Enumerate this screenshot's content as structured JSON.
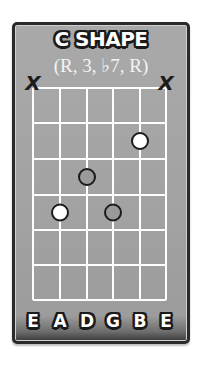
{
  "diagram": {
    "title": "C SHAPE",
    "subtitle": "(R, 3, ♭7, R)",
    "strings": [
      "E",
      "A",
      "D",
      "G",
      "B",
      "E"
    ],
    "string_x": [
      33,
      60,
      87,
      113,
      140,
      166
    ],
    "fret_y": [
      88,
      123,
      159,
      195,
      230,
      265,
      300
    ],
    "muted": [
      {
        "string_index": 0,
        "symbol": "X"
      },
      {
        "string_index": 5,
        "symbol": "X"
      }
    ],
    "dots": [
      {
        "string_index": 4,
        "string": "B",
        "fret": 2,
        "style": "white",
        "role": "R"
      },
      {
        "string_index": 2,
        "string": "D",
        "fret": 3,
        "style": "gray",
        "role": "♭7"
      },
      {
        "string_index": 1,
        "string": "A",
        "fret": 4,
        "style": "white",
        "role": "R"
      },
      {
        "string_index": 3,
        "string": "G",
        "fret": 4,
        "style": "gray",
        "role": "3"
      }
    ],
    "colors": {
      "board": "#a3a3a3",
      "border": "#2a2a2a",
      "grid_line": "#ffffff",
      "dot_white": "#ffffff",
      "dot_gray": "#9a9a9a",
      "dot_outline": "#1a1a1a",
      "text_fill": "#ffffff",
      "text_outline": "#1a1a1a"
    }
  }
}
